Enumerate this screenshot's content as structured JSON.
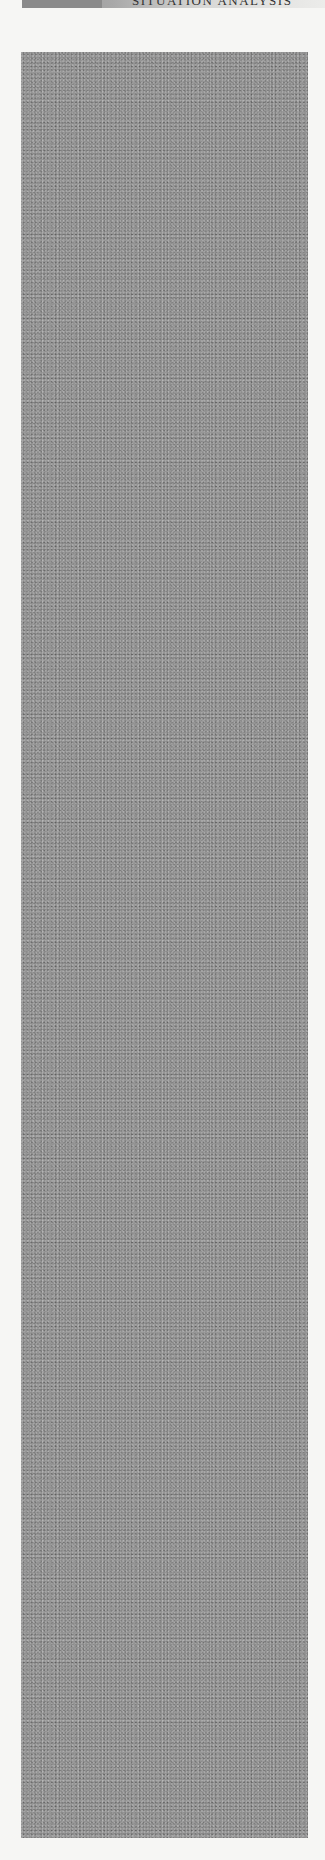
{
  "page": {
    "header": {
      "page_number": "",
      "running_title": "SITUATION ANALYSIS"
    },
    "figure": {
      "description": "grainy noise texture figure",
      "fill_color": "#8e8e8e"
    }
  }
}
